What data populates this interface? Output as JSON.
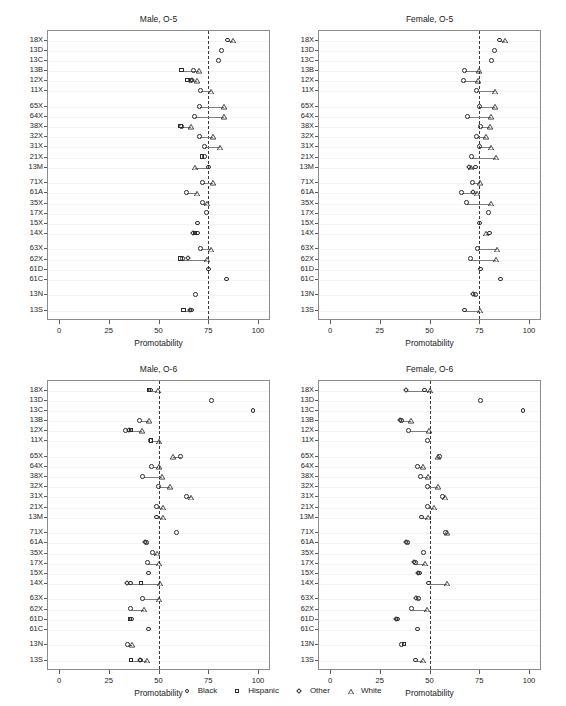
{
  "top_sliver_text": "",
  "axis": {
    "x_title": "Promotability",
    "x_ticks": [
      0,
      25,
      50,
      75,
      100
    ],
    "x_min": 0,
    "x_max": 100
  },
  "legend": {
    "items": [
      {
        "label": "Black",
        "glyph": "circle-icon"
      },
      {
        "label": "Hispanic",
        "glyph": "square-icon"
      },
      {
        "label": "Other",
        "glyph": "diamond-icon"
      },
      {
        "label": "White",
        "glyph": "triangle-icon"
      }
    ]
  },
  "row_labels": [
    "18X",
    "13D",
    "13C",
    "13B",
    "12X",
    "11X",
    "65X",
    "64X",
    "38X",
    "32X",
    "31X",
    "21X",
    "13M",
    "71X",
    "61A",
    "35X",
    "17X",
    "15X",
    "14X",
    "63X",
    "62X",
    "61D",
    "61C",
    "13N",
    "13S"
  ],
  "row_groups": [
    6,
    7,
    6,
    4,
    1,
    1
  ],
  "chart_data": [
    {
      "type": "scatter",
      "title": "Male, O-5",
      "xlabel": "Promotability",
      "ylabel": "",
      "xlim": [
        0,
        100
      ],
      "grid": true,
      "reference_line": 75,
      "categories": [
        "18X",
        "13D",
        "13C",
        "13B",
        "12X",
        "11X",
        "65X",
        "64X",
        "38X",
        "32X",
        "31X",
        "21X",
        "13M",
        "71X",
        "61A",
        "35X",
        "17X",
        "15X",
        "14X",
        "63X",
        "62X",
        "61D",
        "61C",
        "13N",
        "13S"
      ],
      "series": [
        {
          "name": "Black",
          "values": [
            85.0,
            82.0,
            80.5,
            68.0,
            66.5,
            71.5,
            71.0,
            68.5,
            62.0,
            71.0,
            73.5,
            73.5,
            75.5,
            72.5,
            64.5,
            72.5,
            74.5,
            70.0,
            70.0,
            71.5,
            62.5,
            75.5,
            84.5,
            69.0,
            67.0
          ]
        },
        {
          "name": "Hispanic",
          "values": [
            null,
            null,
            null,
            62.0,
            65.0,
            null,
            null,
            null,
            61.5,
            null,
            null,
            72.5,
            null,
            null,
            null,
            null,
            null,
            null,
            69.0,
            null,
            61.5,
            null,
            null,
            null,
            63.0
          ]
        },
        {
          "name": "Other",
          "values": [
            null,
            null,
            null,
            null,
            67.5,
            null,
            null,
            null,
            null,
            null,
            null,
            null,
            null,
            null,
            null,
            null,
            null,
            null,
            68.0,
            null,
            65.5,
            null,
            null,
            null,
            66.5
          ]
        },
        {
          "name": "White",
          "values": [
            87.5,
            null,
            null,
            70.5,
            69.5,
            76.5,
            83.0,
            83.0,
            66.5,
            77.5,
            81.0,
            null,
            68.5,
            77.5,
            69.5,
            74.5,
            null,
            null,
            null,
            76.5,
            74.5,
            null,
            null,
            null,
            null
          ]
        }
      ]
    },
    {
      "type": "scatter",
      "title": "Female, O-5",
      "xlabel": "Promotability",
      "ylabel": "",
      "xlim": [
        0,
        100
      ],
      "grid": true,
      "reference_line": 75,
      "categories": [
        "18X",
        "13D",
        "13C",
        "13B",
        "12X",
        "11X",
        "65X",
        "64X",
        "38X",
        "32X",
        "31X",
        "21X",
        "13M",
        "71X",
        "61A",
        "35X",
        "17X",
        "15X",
        "14X",
        "63X",
        "62X",
        "61D",
        "61C",
        "13N",
        "13S"
      ],
      "series": [
        {
          "name": "Black",
          "values": [
            85.5,
            83.0,
            81.5,
            68.0,
            67.5,
            74.0,
            75.5,
            69.5,
            76.0,
            74.0,
            75.5,
            71.5,
            73.5,
            72.0,
            66.5,
            69.0,
            80.0,
            75.5,
            80.5,
            74.5,
            71.0,
            76.0,
            86.0,
            73.5,
            68.0
          ]
        },
        {
          "name": "Hispanic",
          "values": [
            null,
            null,
            null,
            null,
            null,
            null,
            null,
            null,
            null,
            null,
            null,
            null,
            null,
            null,
            null,
            null,
            null,
            null,
            null,
            null,
            null,
            null,
            null,
            null,
            null
          ]
        },
        {
          "name": "Other",
          "values": [
            null,
            null,
            null,
            null,
            null,
            null,
            null,
            null,
            null,
            null,
            null,
            null,
            70.5,
            null,
            72.5,
            null,
            null,
            null,
            null,
            null,
            null,
            null,
            null,
            72.5,
            null
          ]
        },
        {
          "name": "White",
          "values": [
            88.0,
            null,
            null,
            75.0,
            74.5,
            83.0,
            83.0,
            81.0,
            80.5,
            78.5,
            81.0,
            83.5,
            71.0,
            75.5,
            74.0,
            81.0,
            null,
            null,
            78.5,
            84.0,
            83.5,
            null,
            null,
            null,
            75.5
          ]
        }
      ]
    },
    {
      "type": "scatter",
      "title": "Male, O-6",
      "xlabel": "Promotability",
      "ylabel": "",
      "xlim": [
        0,
        100
      ],
      "grid": true,
      "reference_line": 50,
      "categories": [
        "18X",
        "13D",
        "13C",
        "13B",
        "12X",
        "11X",
        "65X",
        "64X",
        "38X",
        "32X",
        "31X",
        "21X",
        "13M",
        "71X",
        "61A",
        "35X",
        "17X",
        "15X",
        "14X",
        "63X",
        "62X",
        "61D",
        "61C",
        "13N",
        "13S"
      ],
      "series": [
        {
          "name": "Black",
          "values": [
            46.5,
            77.0,
            98.0,
            41.0,
            34.0,
            46.5,
            61.5,
            47.0,
            42.5,
            50.5,
            64.5,
            49.5,
            49.5,
            59.5,
            44.5,
            47.5,
            45.0,
            45.5,
            36.5,
            42.5,
            36.5,
            37.0,
            45.5,
            35.0,
            41.5
          ]
        },
        {
          "name": "Hispanic",
          "values": [
            45.5,
            null,
            null,
            null,
            36.5,
            46.5,
            null,
            null,
            null,
            null,
            null,
            null,
            null,
            null,
            null,
            null,
            null,
            null,
            41.5,
            null,
            null,
            36.0,
            null,
            null,
            36.5
          ]
        },
        {
          "name": "Other",
          "values": [
            null,
            null,
            null,
            null,
            35.5,
            null,
            null,
            null,
            null,
            null,
            null,
            null,
            null,
            null,
            43.5,
            null,
            null,
            null,
            34.5,
            null,
            null,
            null,
            null,
            null,
            41.0
          ]
        },
        {
          "name": "White",
          "values": [
            49.5,
            null,
            null,
            45.0,
            41.5,
            50.5,
            57.5,
            50.0,
            52.0,
            56.0,
            66.5,
            52.5,
            52.5,
            null,
            null,
            49.0,
            50.0,
            null,
            51.0,
            50.5,
            42.5,
            null,
            null,
            36.5,
            44.0
          ]
        }
      ]
    },
    {
      "type": "scatter",
      "title": "Female, O-6",
      "xlabel": "Promotability",
      "ylabel": "",
      "xlim": [
        0,
        100
      ],
      "grid": true,
      "reference_line": 50,
      "categories": [
        "18X",
        "13D",
        "13C",
        "13B",
        "12X",
        "11X",
        "65X",
        "64X",
        "38X",
        "32X",
        "31X",
        "21X",
        "13M",
        "71X",
        "61A",
        "35X",
        "17X",
        "15X",
        "14X",
        "63X",
        "62X",
        "61D",
        "61C",
        "13N",
        "13S"
      ],
      "series": [
        {
          "name": "Black",
          "values": [
            48.0,
            76.0,
            97.5,
            36.5,
            40.0,
            49.5,
            55.5,
            44.5,
            46.0,
            49.5,
            57.0,
            49.5,
            46.5,
            58.5,
            39.5,
            47.5,
            43.5,
            45.5,
            50.0,
            45.0,
            41.5,
            34.5,
            44.5,
            36.5,
            43.5
          ]
        },
        {
          "name": "Hispanic",
          "values": [
            null,
            null,
            null,
            null,
            null,
            null,
            null,
            null,
            null,
            null,
            null,
            null,
            null,
            null,
            null,
            null,
            null,
            null,
            null,
            null,
            null,
            null,
            null,
            37.5,
            null
          ]
        },
        {
          "name": "Other",
          "values": [
            38.5,
            null,
            null,
            35.5,
            null,
            null,
            null,
            null,
            null,
            null,
            null,
            null,
            null,
            null,
            38.5,
            null,
            42.5,
            44.5,
            null,
            43.5,
            null,
            33.5,
            null,
            null,
            null
          ]
        },
        {
          "name": "White",
          "values": [
            50.5,
            null,
            null,
            40.5,
            49.5,
            null,
            54.5,
            46.5,
            49.0,
            54.5,
            58.0,
            52.5,
            49.0,
            59.0,
            null,
            null,
            47.5,
            null,
            59.0,
            null,
            48.5,
            null,
            null,
            null,
            46.5
          ]
        }
      ]
    }
  ]
}
